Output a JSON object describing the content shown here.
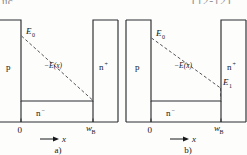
{
  "page": {
    "header_left_fragment": "uc",
    "header_right_fragment": "(12-12)",
    "background_color": "#fdfdfc",
    "line_color": "#2b2c2e",
    "dash_color": "#4a4b4f"
  },
  "figure": {
    "type": "electric-field-distribution-diagram",
    "panels": [
      {
        "id": "a",
        "caption": "a)",
        "regions": [
          {
            "name": "p-region",
            "label": "p"
          },
          {
            "name": "n-minus-region",
            "label": "n",
            "superscript": "−"
          },
          {
            "name": "n-plus-region",
            "label": "n",
            "superscript": "+"
          }
        ],
        "field_curve": {
          "name": "minus-E-of-x",
          "label": "−E(x)",
          "style": "dashed",
          "start_value_label": "E",
          "start_value_sub": "0",
          "end_value_label": "",
          "end_value_sub": "",
          "end_reaches_zero": true
        },
        "axis": {
          "label": "x",
          "origin_tick": "0",
          "end_tick_main": "w",
          "end_tick_sub": "B"
        }
      },
      {
        "id": "b",
        "caption": "b)",
        "regions": [
          {
            "name": "p-region",
            "label": "p"
          },
          {
            "name": "n-minus-region",
            "label": "n",
            "superscript": "−"
          },
          {
            "name": "n-plus-region",
            "label": "n",
            "superscript": "+"
          }
        ],
        "field_curve": {
          "name": "minus-E-of-x",
          "label": "−E(x)",
          "style": "dashed",
          "start_value_label": "E",
          "start_value_sub": "0",
          "end_value_label": "E",
          "end_value_sub": "1",
          "end_reaches_zero": false
        },
        "axis": {
          "label": "x",
          "origin_tick": "0",
          "end_tick_main": "w",
          "end_tick_sub": "B"
        }
      }
    ]
  }
}
